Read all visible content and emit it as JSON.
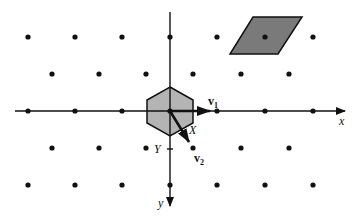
{
  "figure": {
    "width": 357,
    "height": 218,
    "background": "#ffffff",
    "origin": [
      170,
      111
    ],
    "colors": {
      "ink": "#111111",
      "hexagon_fill": "#b4b4b4",
      "parallelogram_fill": "#7a7a7a"
    }
  },
  "axes": {
    "x": {
      "label": "x",
      "from": [
        15,
        111
      ],
      "to": [
        345,
        111
      ],
      "label_pos": [
        339,
        125
      ]
    },
    "y": {
      "label": "y",
      "from": [
        170,
        12
      ],
      "to": [
        170,
        206
      ],
      "label_pos": [
        158,
        207
      ]
    }
  },
  "lattice_points": {
    "rows": [
      {
        "y": 37,
        "xs": [
          28,
          75,
          122,
          170,
          217,
          265,
          313
        ]
      },
      {
        "y": 74,
        "xs": [
          52,
          99,
          146,
          193,
          241,
          289
        ]
      },
      {
        "y": 111,
        "xs": [
          28,
          75,
          122,
          170,
          217,
          265,
          313
        ]
      },
      {
        "y": 148,
        "xs": [
          52,
          99,
          146,
          193,
          241,
          289
        ]
      },
      {
        "y": 185,
        "xs": [
          28,
          75,
          122,
          170,
          217,
          265,
          313
        ]
      }
    ]
  },
  "voronoi_hexagon": {
    "points": "170,87 193,100 193,123 170,136 147,123 147,100"
  },
  "fundamental_parallelogram": {
    "points": "253,17 302,17 278,54 230,54"
  },
  "vectors": [
    {
      "name": "v1",
      "label_main": "v",
      "label_sub": "1",
      "from": [
        170,
        111
      ],
      "to": [
        210,
        111
      ],
      "label_pos": [
        208,
        105
      ]
    },
    {
      "name": "v2",
      "label_main": "v",
      "label_sub": "2",
      "from": [
        170,
        111
      ],
      "to": [
        189,
        142
      ],
      "label_pos": [
        194,
        162
      ]
    }
  ],
  "annotations": [
    {
      "name": "X",
      "text": "X",
      "pos": [
        189,
        134
      ]
    },
    {
      "name": "Y",
      "text": "Y",
      "pos": [
        154,
        153
      ],
      "tick": [
        170,
        149
      ]
    }
  ]
}
